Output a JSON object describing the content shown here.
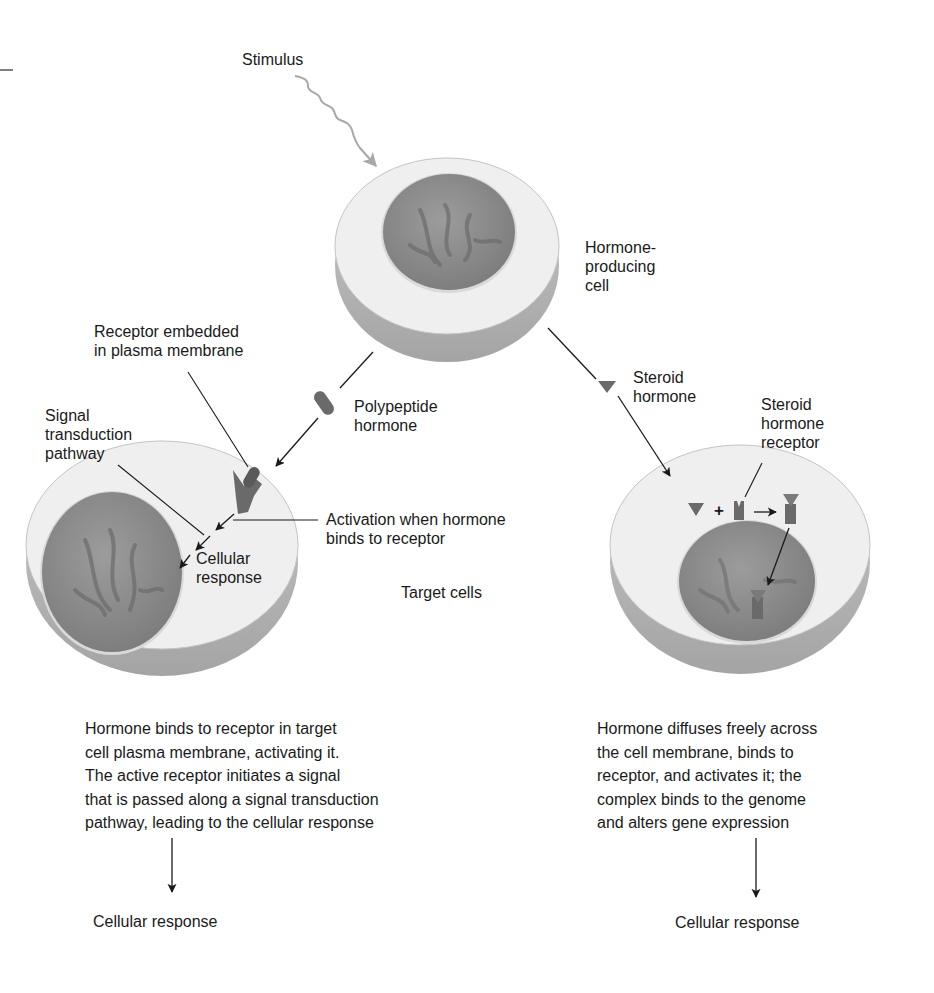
{
  "diagram": {
    "stimulus": "Stimulus",
    "hormone_producing_cell": "Hormone-\nproducing\ncell",
    "receptor_embedded": "Receptor embedded\nin plasma membrane",
    "polypeptide_hormone": "Polypeptide\nhormone",
    "steroid_hormone": "Steroid\nhormone",
    "steroid_hormone_receptor": "Steroid\nhormone\nreceptor",
    "signal_transduction": "Signal\ntransduction\npathway",
    "activation": "Activation when hormone\nbinds to receptor",
    "cellular_response_inner": "Cellular\nresponse",
    "target_cells": "Target cells",
    "plus_sign": "+",
    "left_description": "Hormone binds to receptor in target\ncell plasma membrane, activating it.\nThe active receptor initiates a signal\nthat is passed along a signal transduction\npathway, leading to the cellular response",
    "right_description": "Hormone diffuses freely across\nthe cell membrane, binds to\nreceptor, and activates it; the\ncomplex binds to the genome\nand alters gene expression",
    "left_outcome": "Cellular response",
    "right_outcome": "Cellular response"
  },
  "colors": {
    "cell_top": "#efefef",
    "cell_side": "#b8b8b8",
    "nucleus": "#8f8f8f",
    "hormone": "#6a6a6a",
    "stimulus_line": "#a8a8a8",
    "line": "#1a1a1a"
  }
}
